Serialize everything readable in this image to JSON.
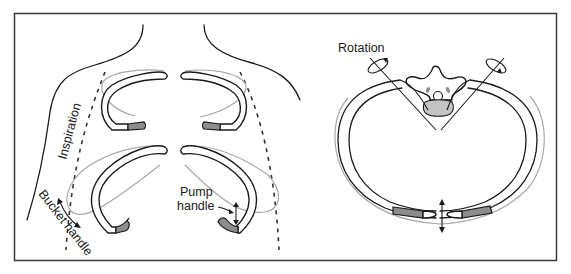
{
  "figure": {
    "panels": [
      {
        "id": "anterior",
        "description": "Anterior view of thorax with upper and lower ribs"
      },
      {
        "id": "transverse",
        "description": "Transverse section of thorax showing vertebra and rib ring"
      }
    ]
  },
  "labels": {
    "inspiration": "Inspiration",
    "bucket_handle": "Bucket handle",
    "pump_handle_line1": "Pump",
    "pump_handle_line2": "handle",
    "rotation": "Rotation"
  },
  "colors": {
    "outline": "#1a1a1a",
    "ghost_position": "#a9a9a9",
    "costal_cartilage": "#8d8d8d",
    "vertebral_body": "#c4c4c4",
    "frame": "#3a3a3a"
  }
}
